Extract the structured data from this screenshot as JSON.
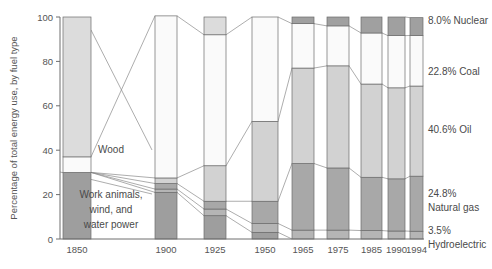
{
  "chart_data": {
    "type": "bar",
    "title": "",
    "subtitle": "",
    "xlabel": "",
    "ylabel": "Percentage of total energy use, by fuel type",
    "ylim": [
      0,
      100
    ],
    "yticks": [
      0,
      20,
      40,
      60,
      80,
      100
    ],
    "ytick_labels": [
      "0",
      "20",
      "40",
      "60",
      "80",
      "100"
    ],
    "grid": false,
    "legend_position": "right-of-plot-inline",
    "stacking": "bottom-to-top",
    "categories": [
      "1850",
      "1900",
      "1925",
      "1950",
      "1965",
      "1975",
      "1985",
      "1990",
      "1994"
    ],
    "series": [
      {
        "name": "Work animals, wind, and water power",
        "color": "#9e9e9e",
        "values": [
          30.0,
          21.0,
          10.5,
          3.0,
          0.0,
          0.0,
          0.0,
          0.0,
          0.0
        ]
      },
      {
        "name": "Hydroelectric",
        "color": "#b5b5b5",
        "values": [
          0.0,
          1.5,
          3.0,
          4.0,
          4.0,
          4.0,
          3.8,
          3.6,
          3.5
        ]
      },
      {
        "name": "Natural gas",
        "color": "#a8a8a8",
        "values": [
          0.0,
          2.5,
          3.5,
          10.0,
          30.0,
          28.0,
          24.0,
          23.5,
          24.8
        ]
      },
      {
        "name": "Oil",
        "color": "#d2d2d2",
        "values": [
          0.0,
          2.5,
          16.0,
          36.0,
          43.0,
          46.0,
          42.0,
          41.0,
          40.6
        ]
      },
      {
        "name": "Coal",
        "color": "#fafafa",
        "values": [
          7.0,
          73.0,
          59.0,
          47.0,
          20.0,
          18.0,
          23.0,
          23.5,
          22.8
        ]
      },
      {
        "name": "Nuclear",
        "color": "#a0a0a0",
        "values": [
          0.0,
          0.0,
          0.0,
          0.0,
          3.0,
          4.0,
          7.2,
          8.4,
          8.0
        ]
      },
      {
        "name": "Wood",
        "color": "#dcdcdc",
        "values": [
          63.0,
          0.0,
          8.0,
          0.0,
          0.0,
          0.0,
          0.0,
          0.0,
          0.0
        ]
      }
    ],
    "annotations": [
      {
        "text": "Wood",
        "role": "inline-series-label"
      },
      {
        "text": "Work animals,",
        "role": "inline-series-label"
      },
      {
        "text": "wind, and",
        "role": "inline-series-label"
      },
      {
        "text": "water power",
        "role": "inline-series-label"
      }
    ],
    "right_labels": [
      {
        "value": "8.0%",
        "name": "Nuclear",
        "text": "8.0% Nuclear"
      },
      {
        "value": "22.8%",
        "name": "Coal",
        "text": "22.8% Coal"
      },
      {
        "value": "40.6%",
        "name": "Oil",
        "text": "40.6% Oil"
      },
      {
        "value": "24.8%",
        "name": "Natural gas",
        "line1": "24.8%",
        "line2": "Natural gas"
      },
      {
        "value": "3.5%",
        "name": "Hydroelectric",
        "line1": "3.5%",
        "line2": "Hydroelectric"
      }
    ]
  },
  "axis": {
    "y_title": "Percentage of total energy use, by fuel type",
    "y_ticks": [
      "100",
      "80",
      "60",
      "40",
      "20",
      "0"
    ],
    "x_ticks": [
      "1850",
      "1900",
      "1925",
      "1950",
      "1965",
      "1975",
      "1985",
      "1990",
      "1994"
    ]
  },
  "inline_labels": {
    "wood": "Wood",
    "work1": "Work animals,",
    "work2": "wind, and",
    "work3": "water power"
  },
  "right_labels": {
    "nuclear": "8.0% Nuclear",
    "coal": "22.8% Coal",
    "oil": "40.6% Oil",
    "gas_pct": "24.8%",
    "gas_name": "Natural gas",
    "hydro_pct": "3.5%",
    "hydro_name": "Hydroelectric"
  },
  "colors": {
    "work_power": "#9e9e9e",
    "hydro": "#b5b5b5",
    "natural_gas": "#a8a8a8",
    "oil": "#d2d2d2",
    "coal": "#fafafa",
    "nuclear": "#a0a0a0",
    "wood": "#dcdcdc",
    "axis": "#6e6e6e",
    "text": "#4a4a4a"
  }
}
